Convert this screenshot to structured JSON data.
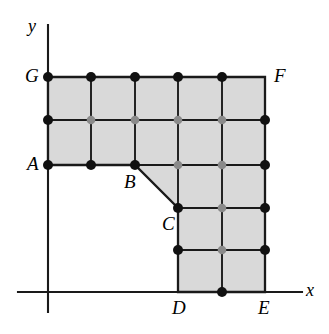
{
  "figure": {
    "type": "geometry-diagram",
    "canvas": {
      "width": 329,
      "height": 334
    },
    "colors": {
      "fill": "#d9d9d9",
      "stroke": "#1a1a1a",
      "axis": "#1a1a1a",
      "node_boundary": "#111111",
      "node_interior": "#8a8a8a",
      "background": "#ffffff"
    },
    "axes": {
      "x_label": "x",
      "y_label": "y",
      "origin": {
        "x": 48,
        "y": 292
      },
      "x_axis_end": {
        "x": 302,
        "y": 292
      },
      "y_axis_end": {
        "x": 48,
        "y": 25
      },
      "x_label_pos": {
        "x": 306,
        "y": 281
      },
      "y_label_pos": {
        "x": 28,
        "y": 17
      }
    },
    "grid": {
      "spacing_x": 43.4,
      "spacing_y": 43.0,
      "columns_px": [
        48,
        91,
        135,
        178,
        222,
        265
      ],
      "rows_px": [
        77,
        120,
        165,
        208,
        250,
        292
      ]
    },
    "vertices": [
      {
        "label": "A",
        "x": 48,
        "y": 165,
        "label_x": 27,
        "label_y": 154
      },
      {
        "label": "B",
        "x": 135,
        "y": 165,
        "label_x": 124,
        "label_y": 172
      },
      {
        "label": "C",
        "x": 178,
        "y": 208,
        "label_x": 162,
        "label_y": 214
      },
      {
        "label": "D",
        "x": 178,
        "y": 292,
        "label_x": 172,
        "label_y": 298
      },
      {
        "label": "E",
        "x": 265,
        "y": 292,
        "label_x": 258,
        "label_y": 298
      },
      {
        "label": "F",
        "x": 265,
        "y": 77,
        "label_x": 274,
        "label_y": 66
      },
      {
        "label": "G",
        "x": 48,
        "y": 77,
        "label_x": 25,
        "label_y": 66
      }
    ],
    "polygon_path": "M 48 165 L 135 165 L 178 208 L 178 292 L 265 292 L 265 77 L 48 77 Z",
    "grid_lines": [
      {
        "name": "h-row-1",
        "x1": 48,
        "y1": 120,
        "x2": 265,
        "y2": 120
      },
      {
        "name": "h-row-2",
        "x1": 48,
        "y1": 165,
        "x2": 265,
        "y2": 165
      },
      {
        "name": "h-row-3",
        "x1": 178,
        "y1": 208,
        "x2": 265,
        "y2": 208
      },
      {
        "name": "h-row-4",
        "x1": 178,
        "y1": 250,
        "x2": 265,
        "y2": 250
      },
      {
        "name": "v-col-1",
        "x1": 91,
        "y1": 77,
        "x2": 91,
        "y2": 165
      },
      {
        "name": "v-col-2",
        "x1": 135,
        "y1": 77,
        "x2": 135,
        "y2": 165
      },
      {
        "name": "v-col-3",
        "x1": 178,
        "y1": 77,
        "x2": 178,
        "y2": 292
      },
      {
        "name": "v-col-4",
        "x1": 222,
        "y1": 77,
        "x2": 222,
        "y2": 292
      }
    ],
    "nodes": [
      {
        "x": 48,
        "y": 77,
        "kind": "boundary"
      },
      {
        "x": 91,
        "y": 77,
        "kind": "boundary"
      },
      {
        "x": 135,
        "y": 77,
        "kind": "boundary"
      },
      {
        "x": 178,
        "y": 77,
        "kind": "boundary"
      },
      {
        "x": 222,
        "y": 77,
        "kind": "boundary"
      },
      {
        "x": 48,
        "y": 120,
        "kind": "boundary"
      },
      {
        "x": 91,
        "y": 120,
        "kind": "interior"
      },
      {
        "x": 135,
        "y": 120,
        "kind": "interior"
      },
      {
        "x": 178,
        "y": 120,
        "kind": "interior"
      },
      {
        "x": 222,
        "y": 120,
        "kind": "interior"
      },
      {
        "x": 265,
        "y": 120,
        "kind": "boundary"
      },
      {
        "x": 48,
        "y": 165,
        "kind": "boundary"
      },
      {
        "x": 91,
        "y": 165,
        "kind": "boundary"
      },
      {
        "x": 135,
        "y": 165,
        "kind": "boundary"
      },
      {
        "x": 178,
        "y": 165,
        "kind": "interior"
      },
      {
        "x": 222,
        "y": 165,
        "kind": "interior"
      },
      {
        "x": 265,
        "y": 165,
        "kind": "boundary"
      },
      {
        "x": 178,
        "y": 208,
        "kind": "boundary"
      },
      {
        "x": 222,
        "y": 208,
        "kind": "interior"
      },
      {
        "x": 265,
        "y": 208,
        "kind": "boundary"
      },
      {
        "x": 178,
        "y": 250,
        "kind": "boundary"
      },
      {
        "x": 222,
        "y": 250,
        "kind": "interior"
      },
      {
        "x": 265,
        "y": 250,
        "kind": "boundary"
      },
      {
        "x": 222,
        "y": 292,
        "kind": "boundary"
      }
    ]
  }
}
